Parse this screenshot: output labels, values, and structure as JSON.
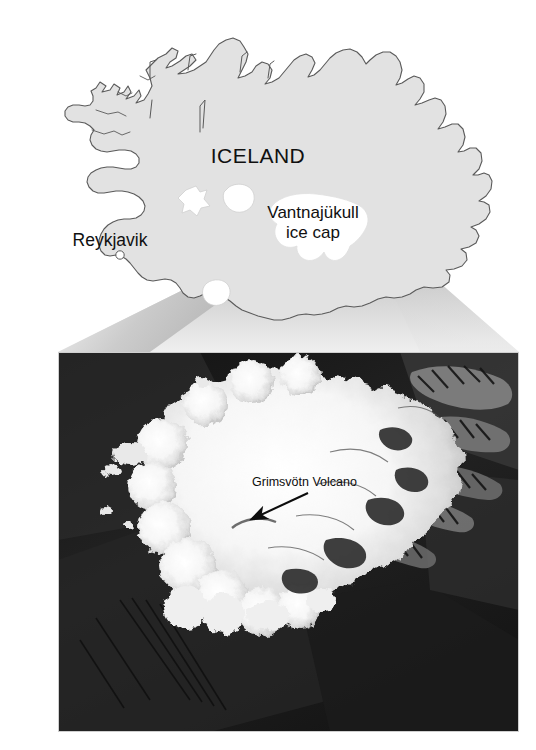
{
  "figure": {
    "width": 536,
    "height": 750,
    "type": "map-with-satellite-inset",
    "background_color": "#ffffff"
  },
  "map": {
    "country_label": "ICELAND",
    "capital_label": "Reykjavik",
    "icecap_label_line1": "Vantnajükull",
    "icecap_label_line2": "ice cap",
    "land_fill": "#e2e2e2",
    "coast_stroke": "#5a5a5a",
    "glacier_fill": "#ffffff",
    "capital_dot_fill": "#ffffff",
    "glaciers": [
      {
        "name": "langjokull-glacier"
      },
      {
        "name": "hofsjokull-glacier"
      },
      {
        "name": "vatnajokull-glacier"
      },
      {
        "name": "myrdalsjokull-glacier"
      }
    ]
  },
  "funnel": {
    "name": "zoom-funnel",
    "fill_light": "#f2f2f2",
    "fill_dark": "#9a9a9a",
    "apex_x": 352,
    "apex_y": 206
  },
  "photo": {
    "caption": "Grimsvötn Volcano",
    "frame": {
      "left": 58,
      "top": 352,
      "width": 461,
      "height": 380
    },
    "border_color": "#d8d8d8",
    "subject": "satellite-image-vatnajokull-ice-cap",
    "arrow": {
      "name": "volcano-pointer-arrow",
      "from_x": 308,
      "from_y": 497,
      "to_x": 258,
      "to_y": 517
    },
    "ice_fill": "#f4f4f4",
    "land_dark": "#1e1e1e"
  }
}
